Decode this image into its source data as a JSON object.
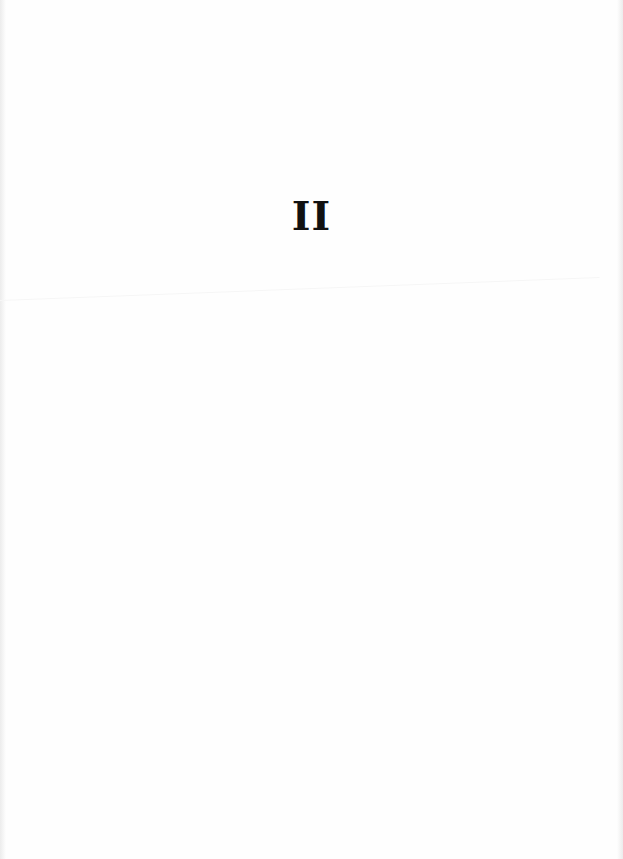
{
  "page": {
    "part_numeral": "II"
  },
  "colors": {
    "background": "#fefefe",
    "text": "#111111"
  }
}
